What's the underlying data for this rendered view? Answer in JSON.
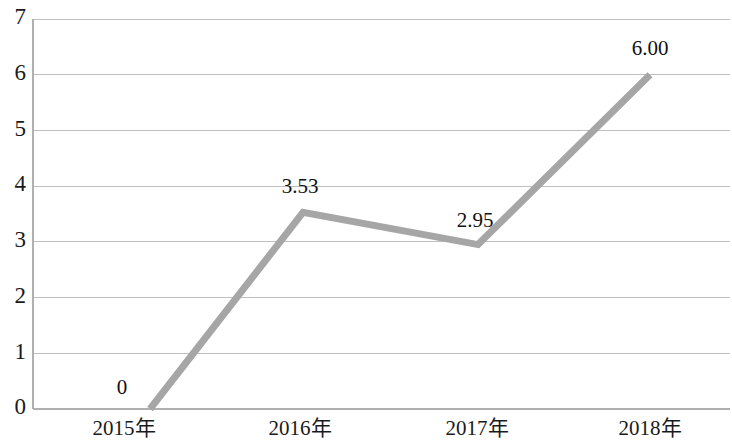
{
  "chart_data": {
    "type": "line",
    "title": "",
    "subtitle": "",
    "xlabel": "",
    "ylabel": "",
    "categories": [
      "2015年",
      "2016年",
      "2017年",
      "2018年"
    ],
    "values": [
      0,
      3.53,
      2.95,
      6.0
    ],
    "point_labels": [
      "0",
      "3.53",
      "2.95",
      "6.00"
    ],
    "series": [
      {
        "name": "",
        "values": [
          0,
          3.53,
          2.95,
          6.0
        ],
        "color": "#a6a6a6"
      }
    ],
    "ylim": [
      0,
      7
    ],
    "ytick_labels": [
      "0",
      "1",
      "2",
      "3",
      "4",
      "5",
      "6",
      "7"
    ],
    "ytick_values": [
      0,
      1,
      2,
      3,
      4,
      5,
      6,
      7
    ],
    "grid": true,
    "grid_axis": "y",
    "grid_color": "#bfbfbf",
    "legend": false,
    "legend_position": "none",
    "markers": false,
    "line_width": 7,
    "background": "#ffffff"
  },
  "axes": {
    "y": {
      "ticks": [
        {
          "label": "7",
          "value": 7
        },
        {
          "label": "6",
          "value": 6
        },
        {
          "label": "5",
          "value": 5
        },
        {
          "label": "4",
          "value": 4
        },
        {
          "label": "3",
          "value": 3
        },
        {
          "label": "2",
          "value": 2
        },
        {
          "label": "1",
          "value": 1
        },
        {
          "label": "0",
          "value": 0
        }
      ]
    },
    "x": {
      "ticks": [
        {
          "label": "2015年"
        },
        {
          "label": "2016年"
        },
        {
          "label": "2017年"
        },
        {
          "label": "2018年"
        }
      ]
    }
  },
  "labels": {
    "p0": "0",
    "p1": "3.53",
    "p2": "2.95",
    "p3": "6.00"
  }
}
